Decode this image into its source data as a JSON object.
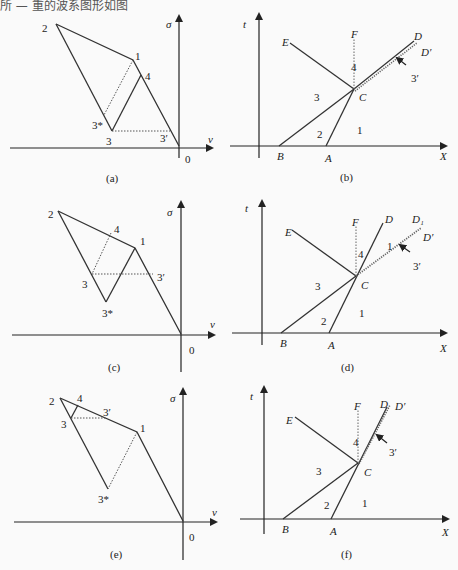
{
  "header_fragment": "所 — 重的波系图形如图",
  "panels": {
    "a": {
      "caption": "(a)",
      "axis_y": "σ",
      "axis_x": "v",
      "origin": "0",
      "points": {
        "p2": "2",
        "p1": "1",
        "p4": "4",
        "p3s": "3*",
        "p3": "3",
        "p3p": "3′"
      }
    },
    "b": {
      "caption": "(b)",
      "axis_y": "t",
      "axis_x": "X",
      "points": {
        "E": "E",
        "F": "F",
        "D": "D",
        "Dp": "D′",
        "C": "C",
        "B": "B",
        "A": "A",
        "r1": "1",
        "r2": "2",
        "r3": "3",
        "r4": "4",
        "r3p": "3′"
      }
    },
    "c": {
      "caption": "(c)",
      "axis_y": "σ",
      "axis_x": "v",
      "origin": "0",
      "points": {
        "p2": "2",
        "p1": "1",
        "p4": "4",
        "p3s": "3*",
        "p3": "3",
        "p3p": "3′"
      }
    },
    "d": {
      "caption": "(d)",
      "axis_y": "t",
      "axis_x": "X",
      "points": {
        "E": "E",
        "F": "F",
        "D": "D",
        "D1": "D₁",
        "Dp": "D′",
        "C": "C",
        "B": "B",
        "A": "A",
        "r1": "1",
        "r1b": "1",
        "r2": "2",
        "r3": "3",
        "r4": "4",
        "r3p": "3′"
      }
    },
    "e": {
      "caption": "(e)",
      "axis_y": "σ",
      "axis_x": "v",
      "origin": "0",
      "points": {
        "p2": "2",
        "p1": "1",
        "p4": "4",
        "p3s": "3*",
        "p3": "3",
        "p3p": "3′"
      }
    },
    "f": {
      "caption": "(f)",
      "axis_y": "t",
      "axis_x": "X",
      "points": {
        "E": "E",
        "F": "F",
        "D": "D",
        "Dp": "D′",
        "C": "C",
        "B": "B",
        "A": "A",
        "r1": "1",
        "r2": "2",
        "r3": "3",
        "r4": "4",
        "r3p": "3′"
      }
    }
  }
}
